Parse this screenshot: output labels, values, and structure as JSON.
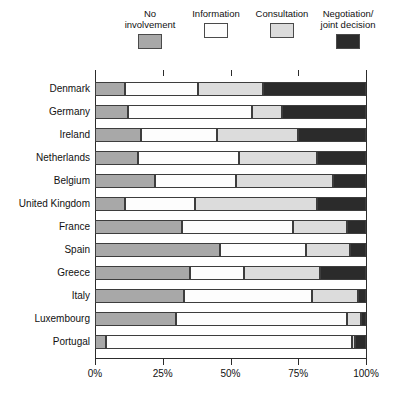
{
  "chart_data": {
    "type": "bar",
    "orientation": "horizontal",
    "stacked": true,
    "normalized": true,
    "title": "",
    "xlabel": "",
    "ylabel": "",
    "xlim": [
      0,
      100
    ],
    "xticks": [
      0,
      25,
      50,
      75,
      100
    ],
    "xtick_labels": [
      "0%",
      "25%",
      "50%",
      "75%",
      "100%"
    ],
    "grid": false,
    "legend_position": "top",
    "categories": [
      "Denmark",
      "Germany",
      "Ireland",
      "Netherlands",
      "Belgium",
      "United Kingdom",
      "France",
      "Spain",
      "Greece",
      "Italy",
      "Luxembourg",
      "Portugal"
    ],
    "series": [
      {
        "name": "No involvement",
        "color": "#a8a8a8",
        "values": [
          11,
          12,
          17,
          16,
          22,
          11,
          32,
          46,
          35,
          33,
          30,
          4
        ]
      },
      {
        "name": "Information",
        "color": "#fdfdfd",
        "values": [
          27,
          46,
          28,
          37,
          30,
          26,
          41,
          32,
          20,
          47,
          63,
          91
        ]
      },
      {
        "name": "Consultation",
        "color": "#dcdcdc",
        "values": [
          24,
          11,
          30,
          29,
          36,
          45,
          20,
          16,
          28,
          17,
          5,
          1
        ]
      },
      {
        "name": "Negotiation/joint decision",
        "color": "#2b2b2b",
        "values": [
          38,
          31,
          25,
          18,
          12,
          18,
          7,
          6,
          17,
          3,
          2,
          4
        ]
      }
    ]
  },
  "legend": {
    "items": [
      {
        "label": "No\ninvolvement",
        "color": "#a8a8a8"
      },
      {
        "label": "Information",
        "color": "#fdfdfd"
      },
      {
        "label": "Consultation",
        "color": "#dcdcdc"
      },
      {
        "label": "Negotiation/\njoint decision",
        "color": "#2b2b2b"
      }
    ]
  },
  "axis": {
    "tick_labels": [
      "0%",
      "25%",
      "50%",
      "75%",
      "100%"
    ]
  }
}
